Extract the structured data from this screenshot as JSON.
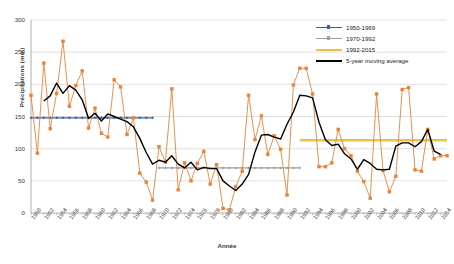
{
  "chart_data": {
    "type": "line",
    "title": "",
    "xlabel": "Année",
    "ylabel": "Précipitations (mm)",
    "ylim": [
      0,
      300
    ],
    "yticks": [
      0,
      50,
      100,
      150,
      200,
      250,
      300
    ],
    "xlim": [
      1950,
      2015
    ],
    "xticks": [
      1950,
      1952,
      1954,
      1956,
      1958,
      1960,
      1962,
      1964,
      1966,
      1968,
      1970,
      1972,
      1974,
      1976,
      1978,
      1980,
      1982,
      1984,
      1986,
      1988,
      1990,
      1992,
      1994,
      1996,
      1998,
      2000,
      2002,
      2004,
      2006,
      2008,
      2010,
      2012,
      2014
    ],
    "grid": "horizontal",
    "legend_position": "top-right",
    "x": [
      1950,
      1951,
      1952,
      1953,
      1954,
      1955,
      1956,
      1957,
      1958,
      1959,
      1960,
      1961,
      1962,
      1963,
      1964,
      1965,
      1966,
      1967,
      1968,
      1969,
      1970,
      1971,
      1972,
      1973,
      1974,
      1975,
      1976,
      1977,
      1978,
      1979,
      1980,
      1981,
      1982,
      1983,
      1984,
      1985,
      1986,
      1987,
      1988,
      1989,
      1990,
      1991,
      1992,
      1993,
      1994,
      1995,
      1996,
      1997,
      1998,
      1999,
      2000,
      2001,
      2002,
      2003,
      2004,
      2005,
      2006,
      2007,
      2008,
      2009,
      2010,
      2011,
      2012,
      2013,
      2014,
      2015
    ],
    "series": [
      {
        "name": "Précipitations annuelles",
        "color": "#E8833A",
        "marker": "square",
        "values": [
          183,
          93,
          233,
          131,
          186,
          267,
          166,
          198,
          221,
          132,
          163,
          124,
          118,
          207,
          196,
          122,
          148,
          62,
          48,
          20,
          103,
          79,
          193,
          36,
          78,
          50,
          77,
          96,
          45,
          75,
          7,
          5,
          41,
          65,
          183,
          114,
          151,
          91,
          120,
          99,
          28,
          199,
          225,
          225,
          185,
          72,
          72,
          78,
          130,
          100,
          89,
          65,
          49,
          23,
          185,
          66,
          33,
          57,
          192,
          195,
          67,
          65,
          130,
          84,
          89,
          89
        ]
      },
      {
        "name": "5-year moving average",
        "color": "#000000",
        "marker": "none",
        "values": [
          null,
          null,
          174,
          182,
          202,
          186,
          198,
          191,
          176,
          147,
          155,
          143,
          154,
          150,
          146,
          142,
          134,
          116,
          94,
          76,
          82,
          79,
          89,
          76,
          70,
          79,
          67,
          71,
          69,
          69,
          50,
          42,
          35,
          45,
          60,
          95,
          121,
          122,
          118,
          115,
          138,
          157,
          183,
          182,
          179,
          141,
          114,
          105,
          107,
          92,
          84,
          68,
          83,
          77,
          68,
          67,
          68,
          104,
          109,
          109,
          103,
          111,
          130,
          96,
          91,
          null
        ]
      },
      {
        "name": "1950-1969",
        "color": "#3A5FA8",
        "marker": "plus",
        "type": "trend",
        "value": 148,
        "x_start": 1950,
        "x_end": 1969
      },
      {
        "name": "1970-1992",
        "color": "#9E9E9E",
        "marker": "plus",
        "type": "trend",
        "value": 70,
        "x_start": 1970,
        "x_end": 1992
      },
      {
        "name": "1992-2015",
        "color": "#F0C040",
        "marker": "line",
        "type": "trend",
        "value": 113,
        "x_start": 1992,
        "x_end": 2015
      }
    ],
    "legend": [
      {
        "label": "1950-1969",
        "color": "#3A5FA8",
        "style": "line-plus"
      },
      {
        "label": "1970-1992",
        "color": "#9E9E9E",
        "style": "line-plus"
      },
      {
        "label": "1992-2015",
        "color": "#F0C040",
        "style": "line"
      },
      {
        "label": "5-year moving average",
        "color": "#000000",
        "style": "line"
      }
    ]
  }
}
